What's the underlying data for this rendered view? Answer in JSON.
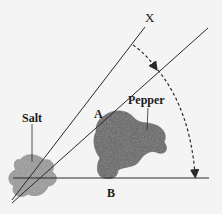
{
  "diagram": {
    "labels": {
      "ray_x": "X",
      "point_a": "A",
      "point_b": "B",
      "salt": "Salt",
      "pepper": "Pepper"
    },
    "colors": {
      "background": "#f4f4f4",
      "line": "#2a2a2a",
      "salt_fill": "#9a9a9a",
      "pepper_fill": "#5e5e5e"
    }
  }
}
